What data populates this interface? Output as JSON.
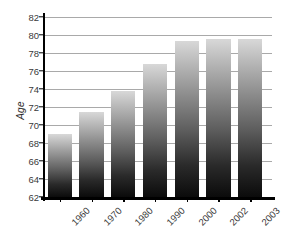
{
  "chart_data": {
    "type": "bar",
    "title": "",
    "subtitle": "",
    "xlabel": "",
    "ylabel": "Age",
    "categories": [
      "1960",
      "1970",
      "1980",
      "1990",
      "2000",
      "2002",
      "2003"
    ],
    "values": [
      69.0,
      71.5,
      73.8,
      76.8,
      79.3,
      79.6,
      79.6
    ],
    "series": [
      {
        "name": "Age",
        "values": [
          69.0,
          71.5,
          73.8,
          76.8,
          79.3,
          79.6,
          79.6
        ]
      }
    ],
    "ylim": [
      62,
      82
    ],
    "ytick_step": 2,
    "yticks": [
      62,
      64,
      66,
      68,
      70,
      72,
      74,
      76,
      78,
      80,
      82
    ],
    "ytick_labels": [
      "62",
      "64",
      "66",
      "68",
      "70",
      "72",
      "74",
      "76",
      "78",
      "80",
      "82"
    ],
    "grid": true,
    "grid_axis": "y",
    "legend": false,
    "legend_position": "none",
    "annotations": [],
    "colors": {
      "bar_top": "#d8d8d8",
      "bar_bottom": "#0b0b0b",
      "gridline": "#a9a9a9",
      "axis": "#000000",
      "text": "#3a3a3a",
      "background": "#ffffff"
    },
    "xtick_rotation": -45
  }
}
